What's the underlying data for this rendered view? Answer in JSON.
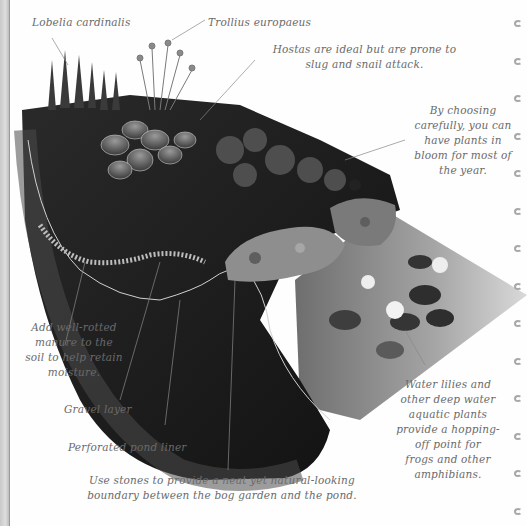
{
  "page": {
    "type": "book page illustration",
    "colors": {
      "background": "#fefefe",
      "label_text": "#6a6a6a",
      "soil": "#1c1c1c",
      "liner": "#3a3a3a",
      "pond_water": "#bdbdbd",
      "stones": "#8e8e8e",
      "binding_rings": "#a8a8a8"
    }
  },
  "labels": {
    "lobelia": "Lobelia cardinalis",
    "trollius": "Trollius europaeus",
    "hostas": [
      "Hostas are ideal but are prone to",
      "slug and snail attack."
    ],
    "choosing": [
      "By choosing",
      "carefully, you can",
      "have plants in",
      "bloom for most of",
      "the year."
    ],
    "manure": [
      "Add well-rotted",
      "manure to the",
      "soil to help retain",
      "moisture."
    ],
    "gravel": "Gravel layer",
    "liner": "Perforated pond liner",
    "stones": [
      "Use stones to provide a neat yet natural-looking",
      "boundary between the bog garden and the pond."
    ],
    "lilies": [
      "Water lilies and",
      "other deep water",
      "aquatic plants",
      "provide a hopping-",
      "off point for",
      "frogs and other",
      "amphibians."
    ]
  },
  "binding": {
    "ring_count": 14,
    "ring_positions_y": [
      20,
      58,
      95,
      133,
      170,
      208,
      245,
      283,
      320,
      358,
      395,
      433,
      470,
      508
    ]
  }
}
